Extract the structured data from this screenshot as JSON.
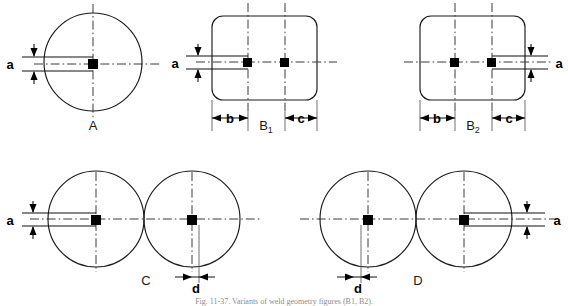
{
  "figure": {
    "caption": "Fig. 11-37. Variants of weld geometry figures (B1, B2).",
    "panels": [
      {
        "id": "A",
        "label": "A",
        "shape": "circle",
        "count": 1,
        "dimensions": [
          {
            "name": "a",
            "label": "a",
            "side": "left",
            "orientation": "vertical"
          }
        ]
      },
      {
        "id": "B1",
        "label": "B",
        "sub": "1",
        "shape": "rounded-rectangle",
        "count": 2,
        "dimensions": [
          {
            "name": "a",
            "label": "a",
            "side": "left",
            "orientation": "vertical"
          },
          {
            "name": "b",
            "label": "b",
            "side": "bottom-left",
            "orientation": "horizontal"
          },
          {
            "name": "c",
            "label": "c",
            "side": "bottom-right",
            "orientation": "horizontal"
          }
        ]
      },
      {
        "id": "B2",
        "label": "B",
        "sub": "2",
        "shape": "rounded-rectangle",
        "count": 2,
        "dimensions": [
          {
            "name": "a",
            "label": "a",
            "side": "right",
            "orientation": "vertical"
          },
          {
            "name": "b",
            "label": "b",
            "side": "bottom-left",
            "orientation": "horizontal"
          },
          {
            "name": "c",
            "label": "c",
            "side": "bottom-right",
            "orientation": "horizontal"
          }
        ]
      },
      {
        "id": "C",
        "label": "C",
        "shape": "twin-circle",
        "count": 2,
        "dimensions": [
          {
            "name": "a",
            "label": "a",
            "side": "left",
            "orientation": "vertical"
          },
          {
            "name": "d",
            "label": "d",
            "side": "bottom-right",
            "orientation": "horizontal"
          }
        ]
      },
      {
        "id": "D",
        "label": "D",
        "shape": "twin-circle",
        "count": 2,
        "dimensions": [
          {
            "name": "a",
            "label": "a",
            "side": "right",
            "orientation": "vertical"
          },
          {
            "name": "d",
            "label": "d",
            "side": "bottom-left",
            "orientation": "horizontal"
          }
        ]
      }
    ],
    "colors": {
      "outline": "#1a1a1a",
      "centerline": "#3a3a3a",
      "dimension": "#111111",
      "marker": "#000000",
      "background": "#ffffff",
      "caption": "#8d8d8d"
    }
  }
}
